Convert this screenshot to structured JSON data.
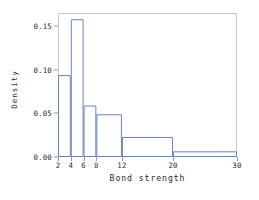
{
  "chart_data": {
    "type": "bar",
    "title": "",
    "subtitle": "",
    "xlabel": "Bond strength",
    "ylabel": "Density",
    "grid": false,
    "legend": false,
    "legend_position": "none",
    "xlim": [
      2,
      30
    ],
    "ylim": [
      0.0,
      0.1652
    ],
    "xticks": [
      2,
      4,
      6,
      8,
      12,
      20,
      30
    ],
    "xtick_labels": [
      "2",
      "4",
      "6",
      "8",
      "12",
      "20",
      "30"
    ],
    "yticks": [
      0.0,
      0.05,
      0.1,
      0.15
    ],
    "ytick_labels": [
      "0.00",
      "0.05",
      "0.10",
      "0.15"
    ],
    "bin_edges": [
      2,
      4,
      6,
      8,
      12,
      20,
      30
    ],
    "categories": [
      "2-4",
      "4-6",
      "6-8",
      "8-12",
      "12-20",
      "20-30"
    ],
    "values": [
      0.094,
      0.158,
      0.059,
      0.049,
      0.023,
      0.0065
    ],
    "bars": [
      {
        "x0": 2,
        "x1": 4,
        "density": 0.094
      },
      {
        "x0": 4,
        "x1": 6,
        "density": 0.158
      },
      {
        "x0": 6,
        "x1": 8,
        "density": 0.059
      },
      {
        "x0": 8,
        "x1": 12,
        "density": 0.049
      },
      {
        "x0": 12,
        "x1": 20,
        "density": 0.023
      },
      {
        "x0": 20,
        "x1": 30,
        "density": 0.0065
      }
    ],
    "colors": {
      "bar_stroke": "#6a84b8",
      "bar_fill": "none",
      "frame": "#c9c9c9",
      "text": "#2b2b2b",
      "tick_mark": "#9a9a9a",
      "background": "#ffffff"
    }
  }
}
